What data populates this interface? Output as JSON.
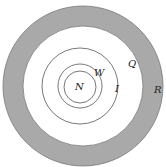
{
  "diagram": {
    "type": "concentric-circles",
    "labels": {
      "N": "N",
      "W": "W",
      "I": "I",
      "Q": "Q",
      "R": "R"
    },
    "colors": {
      "ring_fill": "#a9a9a9",
      "line": "#555555",
      "background": "#ffffff"
    }
  }
}
